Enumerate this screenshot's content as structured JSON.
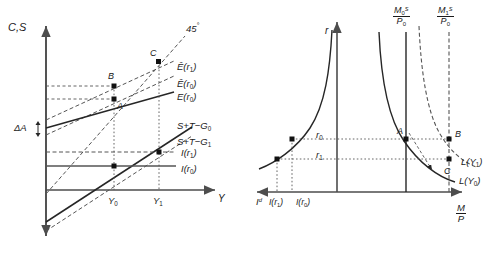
{
  "figure": {
    "panels": [
      {
        "id": "left",
        "name": "expenditure-saving-panel",
        "y_axis_label": "C,S",
        "x_axis_label": "Y",
        "curves": [
          {
            "name": "45-degree-line",
            "label": "45°",
            "style": "dashed"
          },
          {
            "name": "E-hat-r1-curve",
            "label_html": "Ê(r₁)",
            "style": "dashed"
          },
          {
            "name": "E-hat-r0-curve",
            "label_html": "Ê(r₀)",
            "style": "dashed"
          },
          {
            "name": "E-r0-curve",
            "label_html": "E(r₀)",
            "style": "solid"
          },
          {
            "name": "saving-curve-G0",
            "label_html": "S+T−G₀",
            "style": "solid"
          },
          {
            "name": "saving-curve-G1",
            "label_html": "S+T−G₁",
            "style": "dashed"
          },
          {
            "name": "investment-r1-line",
            "label_html": "I(r₁)",
            "style": "dashed"
          },
          {
            "name": "investment-r0-line",
            "label_html": "I(r₀)",
            "style": "solid"
          }
        ],
        "points": [
          {
            "label": "A",
            "x": 0.0,
            "y": 0.0
          },
          {
            "label": "B",
            "x": 0.0,
            "y": 0.0
          },
          {
            "label": "C",
            "x": 0.0,
            "y": 0.0
          }
        ],
        "ticks": [
          {
            "label_html": "Y₀"
          },
          {
            "label_html": "Y₁"
          }
        ],
        "annotations": [
          {
            "name": "delta-A-bracket",
            "label_html": "ΔA"
          }
        ]
      },
      {
        "id": "right",
        "name": "money-market-panel",
        "y_axis_label": "r",
        "x_axis_label_html": "M/P",
        "left_axis_label_html": "Iᵈ",
        "curves": [
          {
            "name": "investment-demand-curve",
            "style": "solid"
          },
          {
            "name": "money-demand-LY0-curve",
            "label_html": "L(Y₀)",
            "style": "solid"
          },
          {
            "name": "money-demand-LY1-curve",
            "label_html": "L(Y₁)",
            "style": "dashed"
          },
          {
            "name": "money-supply-M0-line",
            "label_html": "M₀ˢ/P₀",
            "style": "solid"
          },
          {
            "name": "money-supply-M1-line",
            "label_html": "M₁ˢ/P₀",
            "style": "dashed"
          }
        ],
        "points": [
          {
            "label": "A"
          },
          {
            "label": "B"
          },
          {
            "label": "C"
          }
        ],
        "ticks": [
          {
            "label_html": "r₀"
          },
          {
            "label_html": "r₁"
          },
          {
            "label_html": "I(r₁)"
          },
          {
            "label_html": "I(r₀)"
          }
        ]
      }
    ],
    "colors": {
      "line": "#262626",
      "axis": "#4d4d4d",
      "text": "#1a1a1a",
      "background": "#ffffff"
    },
    "labels": {
      "cs_axis": "C,S",
      "y_axis": "Y",
      "forty_five": "45",
      "degree": "°",
      "E_hat_r1": "Ê(r",
      "A": "A",
      "B": "B",
      "C": "C",
      "A2": "A",
      "B2": "B",
      "C2": "C",
      "delta_A": "ΔA",
      "Y0": "Y",
      "Y1": "Y",
      "r_axis": "r",
      "Id_axis": "I",
      "r0": "r",
      "r1": "r",
      "sub0": "0",
      "sub1": "1",
      "S_T_G": "S+T−G",
      "I_open": "I(r",
      "close": ")",
      "E_open": "E(r",
      "Ehat_open": "Ê(r",
      "L_open": "L(Y",
      "M": "M",
      "P": "P",
      "S_sup": "S",
      "P0": "P"
    }
  }
}
